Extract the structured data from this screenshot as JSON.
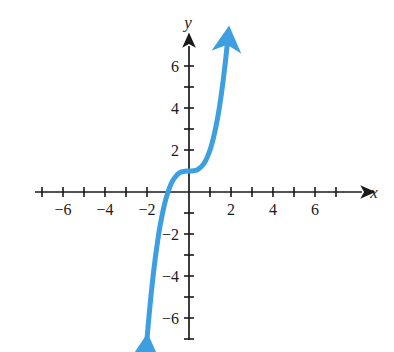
{
  "chart_data": {
    "type": "line",
    "title": "",
    "subtitle": "",
    "xlabel": "x",
    "ylabel": "y",
    "xlim": [
      -7.6,
      8.3
    ],
    "ylim": [
      -7.6,
      7.1
    ],
    "grid": false,
    "legend_position": "none",
    "xticks": [
      -7,
      -6,
      -5,
      -4,
      -3,
      -2,
      -1,
      1,
      2,
      3,
      4,
      5,
      6,
      7
    ],
    "yticks": [
      -7,
      -6,
      -5,
      -4,
      -3,
      -2,
      -1,
      1,
      2,
      3,
      4,
      5,
      6
    ],
    "xtick_labels": [
      {
        "value": -6,
        "text": "−6"
      },
      {
        "value": -4,
        "text": "−4"
      },
      {
        "value": -2,
        "text": "−2"
      },
      {
        "value": 2,
        "text": "2"
      },
      {
        "value": 4,
        "text": "4"
      },
      {
        "value": 6,
        "text": "6"
      }
    ],
    "ytick_labels": [
      {
        "value": 6,
        "text": "6"
      },
      {
        "value": 4,
        "text": "4"
      },
      {
        "value": 2,
        "text": "2"
      },
      {
        "value": -2,
        "text": "−2"
      },
      {
        "value": -4,
        "text": "−4"
      },
      {
        "value": -6,
        "text": "−6"
      }
    ],
    "series": [
      {
        "name": "cubic",
        "equation": "y = x^3 + 1",
        "color": "#3d9fe0",
        "line_width": 5,
        "arrow_start": true,
        "arrow_end": true,
        "points": [
          {
            "x": -2.05,
            "y": -7.62
          },
          {
            "x": -2.0,
            "y": -7.0
          },
          {
            "x": -1.9,
            "y": -5.86
          },
          {
            "x": -1.8,
            "y": -4.83
          },
          {
            "x": -1.7,
            "y": -3.91
          },
          {
            "x": -1.6,
            "y": -3.1
          },
          {
            "x": -1.5,
            "y": -2.38
          },
          {
            "x": -1.4,
            "y": -1.74
          },
          {
            "x": -1.3,
            "y": -1.2
          },
          {
            "x": -1.2,
            "y": -0.73
          },
          {
            "x": -1.1,
            "y": -0.33
          },
          {
            "x": -1.0,
            "y": 0.0
          },
          {
            "x": -0.9,
            "y": 0.27
          },
          {
            "x": -0.8,
            "y": 0.49
          },
          {
            "x": -0.7,
            "y": 0.66
          },
          {
            "x": -0.6,
            "y": 0.78
          },
          {
            "x": -0.5,
            "y": 0.88
          },
          {
            "x": -0.4,
            "y": 0.94
          },
          {
            "x": -0.3,
            "y": 0.97
          },
          {
            "x": -0.2,
            "y": 0.99
          },
          {
            "x": -0.1,
            "y": 1.0
          },
          {
            "x": 0.0,
            "y": 1.0
          },
          {
            "x": 0.1,
            "y": 1.0
          },
          {
            "x": 0.2,
            "y": 1.01
          },
          {
            "x": 0.3,
            "y": 1.03
          },
          {
            "x": 0.4,
            "y": 1.06
          },
          {
            "x": 0.5,
            "y": 1.13
          },
          {
            "x": 0.6,
            "y": 1.22
          },
          {
            "x": 0.7,
            "y": 1.34
          },
          {
            "x": 0.8,
            "y": 1.51
          },
          {
            "x": 0.9,
            "y": 1.73
          },
          {
            "x": 1.0,
            "y": 2.0
          },
          {
            "x": 1.1,
            "y": 2.33
          },
          {
            "x": 1.2,
            "y": 2.73
          },
          {
            "x": 1.3,
            "y": 3.2
          },
          {
            "x": 1.4,
            "y": 3.74
          },
          {
            "x": 1.5,
            "y": 4.38
          },
          {
            "x": 1.6,
            "y": 5.1
          },
          {
            "x": 1.7,
            "y": 5.91
          },
          {
            "x": 1.78,
            "y": 6.64
          },
          {
            "x": 1.82,
            "y": 7.03
          }
        ],
        "key_features": {
          "x_intercept": {
            "x": -1,
            "y": 0
          },
          "y_intercept": {
            "x": 0,
            "y": 1
          },
          "inflection_point": {
            "x": 0,
            "y": 1
          }
        }
      }
    ]
  },
  "figure": {
    "x_axis_label": "x",
    "y_axis_label": "y",
    "background_color": "#ffffff",
    "axis_color": "#1a1a1a",
    "curve_color": "#3d9fe0"
  }
}
